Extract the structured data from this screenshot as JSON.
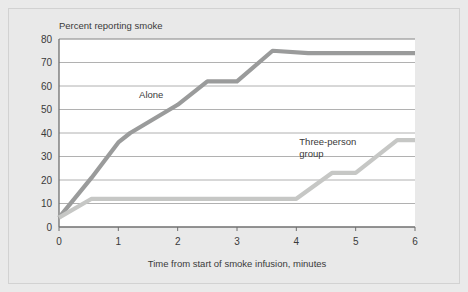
{
  "chart_data": {
    "type": "line",
    "title": "",
    "ylabel": "Percent reporting smoke",
    "xlabel": "Time from start of smoke infusion, minutes",
    "xlim": [
      0,
      6
    ],
    "ylim": [
      0,
      80
    ],
    "xticks": [
      "0",
      "1",
      "2",
      "3",
      "4",
      "5",
      "6"
    ],
    "yticks": [
      "0",
      "10",
      "20",
      "30",
      "40",
      "50",
      "60",
      "70",
      "80"
    ],
    "grid": "horizontal",
    "legend_position": "inline-annotation",
    "series": [
      {
        "name": "Alone",
        "color": "#9a9b9b",
        "label_x": 1.35,
        "label_y": 55,
        "points": [
          {
            "x": 0.0,
            "y": 4
          },
          {
            "x": 0.55,
            "y": 21
          },
          {
            "x": 1.0,
            "y": 36
          },
          {
            "x": 1.2,
            "y": 40
          },
          {
            "x": 2.0,
            "y": 52
          },
          {
            "x": 2.5,
            "y": 62
          },
          {
            "x": 3.0,
            "y": 62
          },
          {
            "x": 3.6,
            "y": 75
          },
          {
            "x": 4.2,
            "y": 74
          },
          {
            "x": 6.0,
            "y": 74
          }
        ]
      },
      {
        "name": "Three-person group",
        "color": "#c6c7c5",
        "label_line1": "Three-person",
        "label_line2": "group",
        "label_x": 4.05,
        "label_y": 35,
        "points": [
          {
            "x": 0.0,
            "y": 4
          },
          {
            "x": 0.55,
            "y": 12
          },
          {
            "x": 4.0,
            "y": 12
          },
          {
            "x": 4.6,
            "y": 23
          },
          {
            "x": 5.0,
            "y": 23
          },
          {
            "x": 5.7,
            "y": 37
          },
          {
            "x": 6.0,
            "y": 37
          }
        ]
      }
    ],
    "colors": {
      "plot_background": "#ffffff",
      "figure_background": "#e9e9e9",
      "gridline": "#9d9d9d",
      "axis": "#6f6f6f",
      "text": "#3a3a3a"
    }
  }
}
